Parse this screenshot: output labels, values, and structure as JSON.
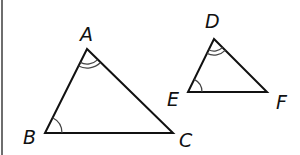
{
  "diagram": {
    "type": "similar-triangles",
    "colors": {
      "stroke": "#111111",
      "arc": "#444444",
      "border": "#6e6e6e",
      "background": "#ffffff"
    },
    "triangles": [
      {
        "name": "ABC",
        "vertices": [
          {
            "label": "A",
            "x": 87,
            "y": 49,
            "lx": 80,
            "ly": 41
          },
          {
            "label": "B",
            "x": 45,
            "y": 133,
            "lx": 23,
            "ly": 144
          },
          {
            "label": "C",
            "x": 173,
            "y": 133,
            "lx": 179,
            "ly": 147
          }
        ],
        "angle_marks": [
          {
            "vertex": "A",
            "arcs": 2
          },
          {
            "vertex": "B",
            "arcs": 1
          }
        ]
      },
      {
        "name": "DEF",
        "vertices": [
          {
            "label": "D",
            "x": 214,
            "y": 39,
            "lx": 205,
            "ly": 28
          },
          {
            "label": "E",
            "x": 188,
            "y": 92,
            "lx": 167,
            "ly": 106
          },
          {
            "label": "F",
            "x": 267,
            "y": 92,
            "lx": 276,
            "ly": 109
          }
        ],
        "angle_marks": [
          {
            "vertex": "D",
            "arcs": 2
          },
          {
            "vertex": "E",
            "arcs": 1
          }
        ]
      }
    ]
  }
}
